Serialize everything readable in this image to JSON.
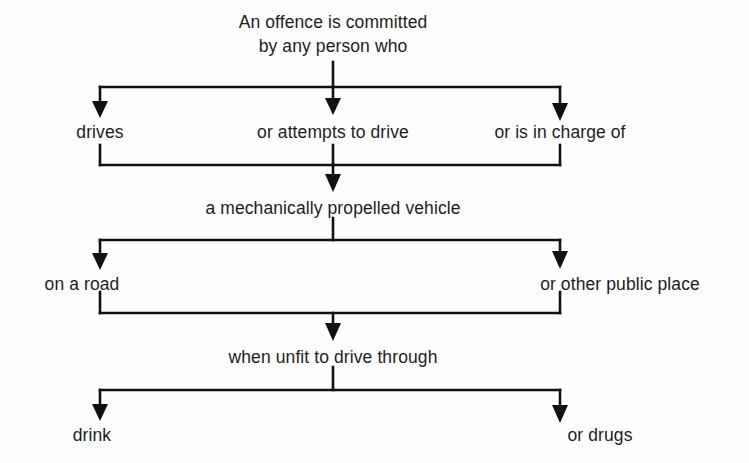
{
  "diagram": {
    "title": "An offence is committed by any person who",
    "background_color": "#fefefe",
    "line_color": "#111111",
    "text_color": "#1c1c1c",
    "nodes": {
      "root_line1": "An offence is committed",
      "root_line2": "by any person who",
      "branch1_left": "drives",
      "branch1_center": "or attempts to drive",
      "branch1_right": "or is in charge of",
      "merge1": "a mechanically propelled vehicle",
      "branch2_left": "on a road",
      "branch2_right": "or other public place",
      "merge2": "when unfit to drive through",
      "branch3_left": "drink",
      "branch3_right": "or drugs"
    },
    "layout": {
      "width": 749,
      "height": 463,
      "center_x": 333,
      "left_x": 100,
      "right_x": 560,
      "rows": [
        {
          "name": "root",
          "text_y": 10
        },
        {
          "name": "split1",
          "bar_y": 87,
          "arrow_end_y": 116,
          "label_y": 120
        },
        {
          "name": "merge1",
          "bar_y": 165,
          "arrow_end_y": 192,
          "label_y": 196
        },
        {
          "name": "split2",
          "bar_y": 240,
          "arrow_end_y": 268,
          "label_y": 272
        },
        {
          "name": "merge2",
          "bar_y": 313,
          "arrow_end_y": 341,
          "label_y": 345
        },
        {
          "name": "split3",
          "bar_y": 390,
          "arrow_end_y": 419,
          "label_y": 423
        }
      ]
    }
  }
}
